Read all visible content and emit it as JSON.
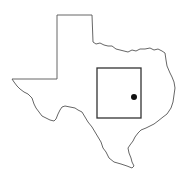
{
  "map": {
    "subject": "Texas state outline",
    "colors": {
      "outline": "#555555",
      "region_box": "#333333",
      "marker": "#111111",
      "background": "#ffffff"
    },
    "region_box": {
      "x": 97,
      "y": 68,
      "width": 44,
      "height": 50
    },
    "marker": {
      "cx": 134,
      "cy": 97,
      "r": 3
    }
  }
}
